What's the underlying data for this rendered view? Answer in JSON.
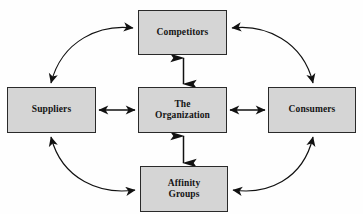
{
  "diagram": {
    "type": "hub-and-spoke relationship diagram",
    "style": {
      "box_fill": "#d5d5d5",
      "box_border": "#2a2a2a",
      "arrow_color": "#111111",
      "background": "#fefefe"
    },
    "nodes": [
      {
        "id": "competitors",
        "label": "Competitors",
        "position": "top"
      },
      {
        "id": "suppliers",
        "label": "Suppliers",
        "position": "left"
      },
      {
        "id": "center",
        "label": "The\nOrganization",
        "position": "center"
      },
      {
        "id": "consumers",
        "label": "Consumers",
        "position": "right"
      },
      {
        "id": "affinity",
        "label": "Affinity\nGroups",
        "position": "bottom"
      }
    ],
    "connections": [
      {
        "id": "center-competitors",
        "from": "center",
        "to": "competitors",
        "shape": "straight",
        "direction": "bidirectional"
      },
      {
        "id": "center-affinity",
        "from": "center",
        "to": "affinity",
        "shape": "straight",
        "direction": "bidirectional"
      },
      {
        "id": "suppliers-center",
        "from": "suppliers",
        "to": "center",
        "shape": "straight",
        "direction": "bidirectional"
      },
      {
        "id": "center-consumers",
        "from": "center",
        "to": "consumers",
        "shape": "straight",
        "direction": "bidirectional"
      },
      {
        "id": "suppliers-competitors",
        "from": "suppliers",
        "to": "competitors",
        "shape": "curved",
        "direction": "bidirectional"
      },
      {
        "id": "competitors-consumers",
        "from": "competitors",
        "to": "consumers",
        "shape": "curved",
        "direction": "bidirectional"
      },
      {
        "id": "suppliers-affinity",
        "from": "suppliers",
        "to": "affinity",
        "shape": "curved",
        "direction": "bidirectional"
      },
      {
        "id": "affinity-consumers",
        "from": "affinity",
        "to": "consumers",
        "shape": "curved",
        "direction": "bidirectional"
      }
    ]
  }
}
